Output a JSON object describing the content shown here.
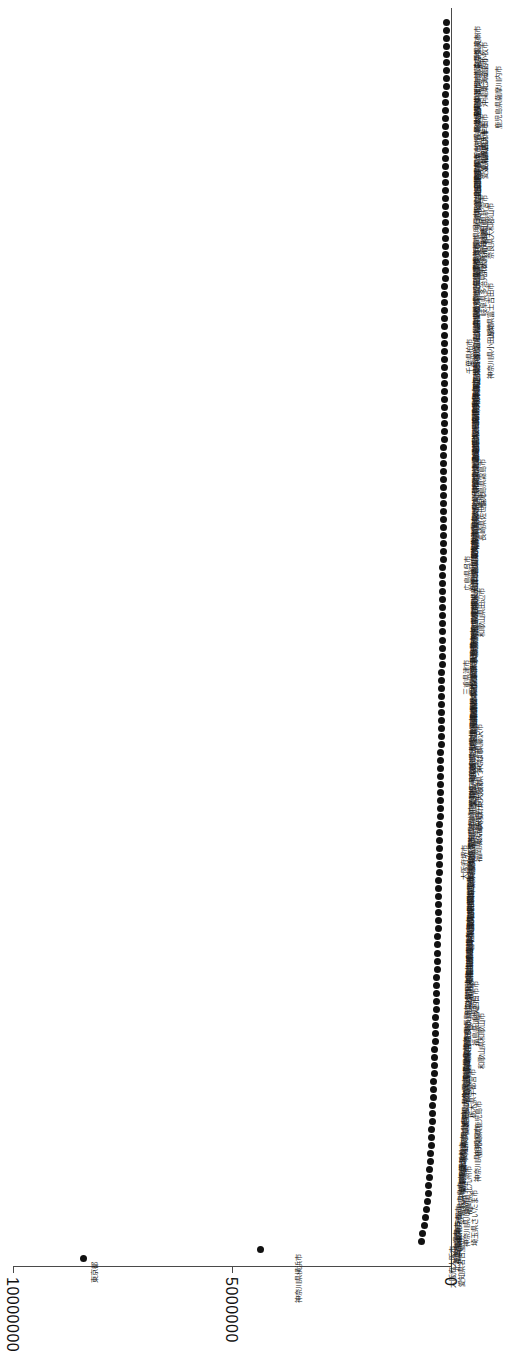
{
  "chart_data": {
    "type": "scatter",
    "title": "",
    "subtitle": "",
    "xlabel": "",
    "ylabel": "",
    "orientation": "rotated-90-ccw",
    "grid": false,
    "legend": null,
    "value_axis": {
      "ticks": [
        "10000000",
        "5000000",
        "0"
      ],
      "tick_values": [
        10000000,
        5000000,
        0
      ],
      "min": 0,
      "max": 10000000
    },
    "note": "Rank-ordered dot plot: each category plotted against a count value; values decay steeply after the top two categories.",
    "categories": [
      "東京都",
      "神奈川県横浜市",
      "大阪府大阪市",
      "愛知県名古屋市",
      "北海道札幌市",
      "福岡県福岡市",
      "兵庫県神戸市",
      "京都府京都市",
      "神奈川県川崎市",
      "埼玉県さいたま市",
      "広島県広島市",
      "宮城県仙台市",
      "福岡県北九州市",
      "千葉県千葉市",
      "新潟県新潟市",
      "静岡県浜松市",
      "熊本県熊本市",
      "神奈川県相模原市",
      "岡山県岡山市",
      "静岡県静岡市",
      "鹿児島県鹿児島市",
      "愛媛県松山市",
      "大分県大分市",
      "石川県金沢市",
      "栃木県宇都宮市",
      "長崎県長崎市",
      "富山県富山市",
      "岐阜県岐阜市",
      "群馬県高崎市",
      "宮崎県宮崎市",
      "奈良県奈良市",
      "和歌山県和歌山市",
      "長野県長野市",
      "福島県いわき市",
      "香川県高松市",
      "三重県四日市市",
      "山口県下関市",
      "滋賀県大津市",
      "福井県福井市",
      "山形県山形市",
      "徳島県徳島市",
      "高知県高知市",
      "青森県青森市",
      "秋田県秋田市",
      "岩手県盛岡市",
      "佐賀県佐賀市",
      "山梨県甲府市",
      "鳥取県鳥取市",
      "島根県松江市",
      "沖縄県那覇市",
      "茨城県水戸市",
      "千葉県船橋市",
      "大阪府堺市",
      "兵庫県姫路市",
      "愛知県豊田市",
      "埼玉県川口市",
      "福岡県久留米市",
      "愛知県岡崎市",
      "東京都八王子市",
      "兵庫県西宮市",
      "大阪府東大阪市",
      "千葉県松戸市",
      "愛知県一宮市",
      "埼玉県川越市",
      "茨城県つくば市",
      "東京都町田市",
      "岐阜県大垣市",
      "神奈川県藤沢市",
      "奈良県橿原市",
      "新潟県長岡市",
      "広島県福山市",
      "岡山県倉敷市",
      "長野県松本市",
      "群馬県前橋市",
      "栃木県小山市",
      "三重県津市",
      "滋賀県草津市",
      "京都府宇治市",
      "兵庫県尼崎市",
      "大阪府豊中市",
      "大阪府吹田市",
      "大阪府枚方市",
      "大阪府高槻市",
      "奈良県生駒市",
      "和歌山県田辺市",
      "鳥取県米子市",
      "島根県出雲市",
      "岡山県津山市",
      "広島県呉市",
      "山口県山口市",
      "徳島県鳴門市",
      "香川県丸亀市",
      "愛媛県今治市",
      "高知県南国市",
      "福岡県飯塚市",
      "佐賀県唐津市",
      "長崎県佐世保市",
      "熊本県八代市",
      "大分県別府市",
      "宮崎県都城市",
      "鹿児島県霧島市",
      "沖縄県沖縄市",
      "北海道旭川市",
      "北海道函館市",
      "北海道釧路市",
      "青森県八戸市",
      "岩手県一関市",
      "宮城県石巻市",
      "秋田県横手市",
      "山形県鶴岡市",
      "福島県郡山市",
      "茨城県日立市",
      "栃木県足利市",
      "群馬県太田市",
      "埼玉県熊谷市",
      "千葉県柏市",
      "東京都立川市",
      "神奈川県小田原市",
      "新潟県上越市",
      "富山県高岡市",
      "石川県小松市",
      "福井県敦賀市",
      "山梨県富士吉田市",
      "長野県上田市",
      "岐阜県多治見市",
      "静岡県沼津市",
      "愛知県豊橋市",
      "三重県伊勢市",
      "滋賀県彦根市",
      "京都府福知山市",
      "大阪府岸和田市",
      "兵庫県明石市",
      "奈良県大和郡山市",
      "和歌山県新宮市",
      "鳥取県倉吉市",
      "島根県浜田市",
      "岡山県玉野市",
      "広島県尾道市",
      "山口県宇部市",
      "徳島県阿南市",
      "香川県坂出市",
      "愛媛県新居浜市",
      "高知県四万十市",
      "福岡県大牟田市",
      "佐賀県鳥栖市",
      "長崎県諫早市",
      "熊本県天草市",
      "大分県中津市",
      "宮崎県延岡市",
      "鹿児島県薩摩川内市",
      "沖縄県うるま市",
      "北海道帯広市",
      "北海道苫小牧市",
      "青森県弘前市",
      "岩手県奥州市"
    ],
    "values": [
      8380000,
      4360000,
      680000,
      640000,
      600000,
      575000,
      555000,
      540000,
      525000,
      510000,
      498000,
      486000,
      475000,
      465000,
      455000,
      446000,
      437000,
      429000,
      421000,
      413000,
      406000,
      399000,
      392000,
      385000,
      379000,
      373000,
      367000,
      361000,
      355000,
      350000,
      345000,
      340000,
      335000,
      330000,
      325000,
      320000,
      316000,
      312000,
      308000,
      304000,
      300000,
      296000,
      292000,
      288000,
      285000,
      281000,
      278000,
      274000,
      271000,
      268000,
      265000,
      262000,
      259000,
      256000,
      253000,
      250000,
      247000,
      245000,
      242000,
      239000,
      237000,
      234000,
      232000,
      229000,
      227000,
      225000,
      222000,
      220000,
      218000,
      216000,
      213000,
      211000,
      209000,
      207000,
      205000,
      203000,
      201000,
      199000,
      197000,
      196000,
      194000,
      192000,
      190000,
      188000,
      187000,
      185000,
      183000,
      182000,
      180000,
      178000,
      177000,
      175000,
      174000,
      172000,
      171000,
      169000,
      168000,
      166000,
      165000,
      163000,
      162000,
      161000,
      159000,
      158000,
      157000,
      155000,
      154000,
      153000,
      152000,
      150000,
      149000,
      148000,
      147000,
      146000,
      144000,
      143000,
      142000,
      141000,
      140000,
      139000,
      138000,
      137000,
      136000,
      135000,
      134000,
      133000,
      132000,
      131000,
      130000,
      129000,
      128000,
      127000,
      126000,
      125000,
      124000,
      123000,
      122000,
      121000,
      121000,
      120000,
      119000,
      118000,
      117000,
      116000,
      116000,
      115000,
      114000,
      113000,
      113000,
      112000,
      111000,
      110000,
      110000,
      109000,
      108000
    ]
  }
}
